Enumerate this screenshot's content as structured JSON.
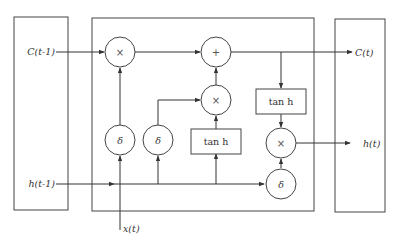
{
  "diagram": {
    "type": "LSTM cell",
    "inputs": {
      "cell_prev": "C(t-1)",
      "hidden_prev": "h(t-1)",
      "x_input": "x(t)"
    },
    "outputs": {
      "cell_out": "C(t)",
      "hidden_out": "h(t)"
    },
    "nodes": {
      "forget_mult": "×",
      "add": "+",
      "input_mult": "×",
      "output_mult": "×",
      "forget_gate": "δ",
      "input_gate": "δ",
      "output_gate": "δ",
      "tanh_candidate": "tan h",
      "tanh_cell": "tan h"
    }
  }
}
